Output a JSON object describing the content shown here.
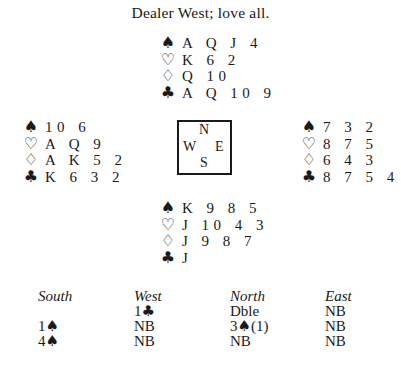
{
  "title": "Dealer West; love all.",
  "suit_symbols": {
    "spades": "♠",
    "hearts": "♡",
    "diamonds": "♢",
    "clubs": "♣"
  },
  "hands": {
    "north": {
      "spades": "A Q J 4",
      "hearts": "K 6 2",
      "diamonds": "Q 10",
      "clubs": "A Q 10 9"
    },
    "west": {
      "spades": "10 6",
      "hearts": "A Q 9",
      "diamonds": "A K 5 2",
      "clubs": "K 6 3 2"
    },
    "east": {
      "spades": "7 3 2",
      "hearts": "8 7 5",
      "diamonds": "6 4 3",
      "clubs": "8 7 5 4"
    },
    "south": {
      "spades": "K 9 8 5",
      "hearts": "J 10 4 3",
      "diamonds": "J 9 8 7",
      "clubs": "J"
    }
  },
  "compass": {
    "north": "N",
    "west": "W",
    "east": "E",
    "south": "S"
  },
  "bidding": {
    "headers": [
      "South",
      "West",
      "North",
      "East"
    ],
    "rows": [
      [
        {
          "text": "",
          "suit": ""
        },
        {
          "text": "1",
          "suit": "♣",
          "note": ""
        },
        {
          "text": "Dble",
          "suit": "",
          "note": ""
        },
        {
          "text": "NB",
          "suit": "",
          "note": ""
        }
      ],
      [
        {
          "text": "1",
          "suit": "♠",
          "note": ""
        },
        {
          "text": "NB",
          "suit": "",
          "note": ""
        },
        {
          "text": "3",
          "suit": "♠",
          "note": "(1)"
        },
        {
          "text": "NB",
          "suit": "",
          "note": ""
        }
      ],
      [
        {
          "text": "4",
          "suit": "♠",
          "note": ""
        },
        {
          "text": "NB",
          "suit": "",
          "note": ""
        },
        {
          "text": "NB",
          "suit": "",
          "note": ""
        },
        {
          "text": "NB",
          "suit": "",
          "note": ""
        }
      ]
    ]
  }
}
